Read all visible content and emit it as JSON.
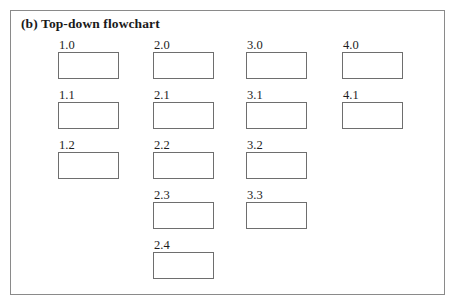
{
  "figure": {
    "caption": "(b) Top-down flowchart",
    "border_color": "#8a8a8a",
    "background_color": "#ffffff",
    "box_border_color": "#6e6e6e",
    "text_color": "#1d1d1d"
  },
  "columns": [
    {
      "name": "column-1",
      "nodes": [
        {
          "label": "1.0"
        },
        {
          "label": "1.1"
        },
        {
          "label": "1.2"
        }
      ]
    },
    {
      "name": "column-2",
      "nodes": [
        {
          "label": "2.0"
        },
        {
          "label": "2.1"
        },
        {
          "label": "2.2"
        },
        {
          "label": "2.3"
        },
        {
          "label": "2.4"
        }
      ]
    },
    {
      "name": "column-3",
      "nodes": [
        {
          "label": "3.0"
        },
        {
          "label": "3.1"
        },
        {
          "label": "3.2"
        },
        {
          "label": "3.3"
        }
      ]
    },
    {
      "name": "column-4",
      "nodes": [
        {
          "label": "4.0"
        },
        {
          "label": "4.1"
        }
      ]
    }
  ],
  "layout": {
    "row_pitch": 50,
    "box_width": 61,
    "box_height": 27
  }
}
